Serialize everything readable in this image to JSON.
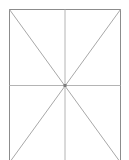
{
  "diagram": {
    "colors": {
      "background": "#ffffff",
      "frame": "#8c8c8c",
      "lines": "#a8a8a8",
      "center_dot": "#7a7a7a"
    },
    "frame": {
      "x": 9.5,
      "y": 9.5,
      "width": 111,
      "height": 153
    },
    "center": {
      "x": 65,
      "y": 85.5
    }
  }
}
